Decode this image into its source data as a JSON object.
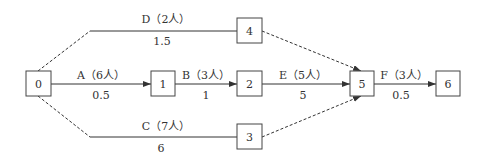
{
  "diagram": {
    "type": "activity-on-arrow network",
    "nodes": [
      {
        "id": "0",
        "label": "0"
      },
      {
        "id": "1",
        "label": "1"
      },
      {
        "id": "2",
        "label": "2"
      },
      {
        "id": "3",
        "label": "3"
      },
      {
        "id": "4",
        "label": "4"
      },
      {
        "id": "5",
        "label": "5"
      },
      {
        "id": "6",
        "label": "6"
      }
    ],
    "activities": [
      {
        "name": "A（6人）",
        "duration": "0.5",
        "from": "0",
        "to": "1"
      },
      {
        "name": "B（3人）",
        "duration": "1",
        "from": "1",
        "to": "2"
      },
      {
        "name": "E（5人）",
        "duration": "5",
        "from": "2",
        "to": "5"
      },
      {
        "name": "F（3人）",
        "duration": "0.5",
        "from": "5",
        "to": "6"
      },
      {
        "name": "D（2人）",
        "duration": "1.5",
        "from": "0",
        "to": "4"
      },
      {
        "name": "C（7人）",
        "duration": "6",
        "from": "0",
        "to": "3"
      }
    ],
    "dummy_links": [
      {
        "from": "4",
        "to": "5"
      },
      {
        "from": "3",
        "to": "5"
      }
    ],
    "colors": {
      "line": "#333333",
      "box_border": "#444444"
    }
  }
}
